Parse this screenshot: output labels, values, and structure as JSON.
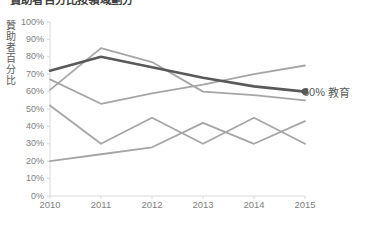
{
  "chart_data": {
    "type": "line",
    "title": "贊助者百分比按領域劃分",
    "xlabel": "",
    "ylabel": "贊助者百分比",
    "x": [
      "2010",
      "2011",
      "2012",
      "2013",
      "2014",
      "2015"
    ],
    "xlim": [
      2010,
      2015
    ],
    "ylim": [
      0,
      100
    ],
    "y_ticks": [
      "0%",
      "10%",
      "20%",
      "30%",
      "40%",
      "50%",
      "60%",
      "70%",
      "80%",
      "90%",
      "100%"
    ],
    "y_tick_values": [
      0,
      10,
      20,
      30,
      40,
      50,
      60,
      70,
      80,
      90,
      100
    ],
    "grid": false,
    "legend_position": "right-inline",
    "series": [
      {
        "name": "教育",
        "highlight": true,
        "color": "#595959",
        "width": 2.6,
        "marker_end": true,
        "values": [
          72,
          80,
          74,
          68,
          63,
          60
        ]
      },
      {
        "name": "series-2",
        "highlight": false,
        "color": "#a6a6a6",
        "width": 1.8,
        "marker_end": false,
        "values": [
          61,
          85,
          77,
          60,
          58,
          55
        ]
      },
      {
        "name": "series-3",
        "highlight": false,
        "color": "#a6a6a6",
        "width": 1.8,
        "marker_end": false,
        "values": [
          67,
          53,
          59,
          64,
          70,
          75
        ]
      },
      {
        "name": "series-4",
        "highlight": false,
        "color": "#a6a6a6",
        "width": 1.8,
        "marker_end": false,
        "values": [
          52,
          30,
          45,
          30,
          45,
          30
        ]
      },
      {
        "name": "series-5",
        "highlight": false,
        "color": "#a6a6a6",
        "width": 1.8,
        "marker_end": false,
        "values": [
          20,
          24,
          28,
          42,
          30,
          43
        ]
      }
    ],
    "annotations": [
      {
        "name": "end-label",
        "value_text": "60%",
        "label_text": "教育",
        "at_x": "2015",
        "at_y": 60
      }
    ]
  },
  "colors": {
    "background": "#ffffff",
    "highlight_series": "#595959",
    "muted_series": "#a6a6a6",
    "axis_line": "#d9d9d9",
    "tick_text": "#808080",
    "title_text": "#404040"
  }
}
